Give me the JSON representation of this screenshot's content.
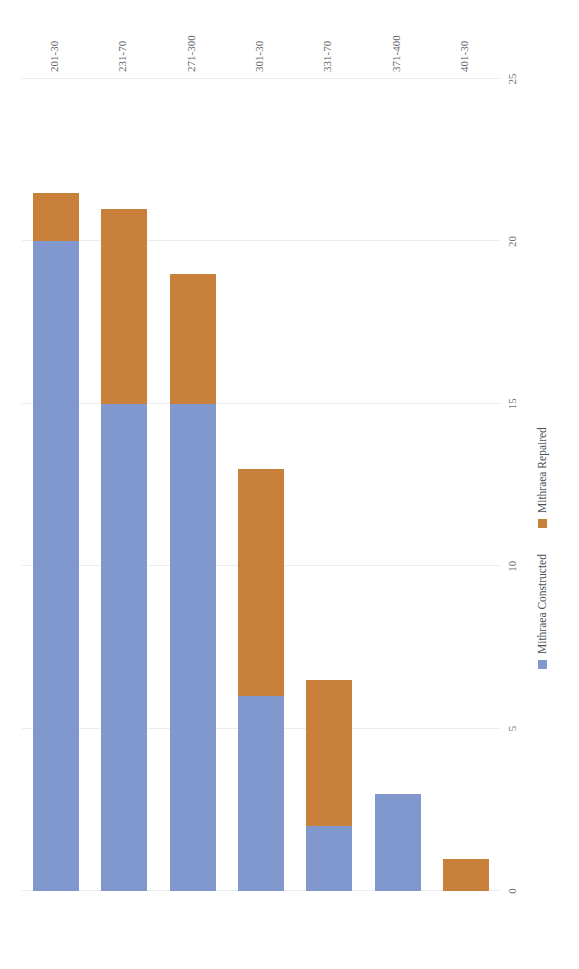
{
  "chart_data": {
    "type": "bar",
    "orientation": "horizontal-stacked-rotated",
    "title": "",
    "xlabel": "",
    "ylabel": "",
    "categories": [
      "201-30",
      "231-70",
      "271-300",
      "301-30",
      "331-70",
      "371-400",
      "401-30"
    ],
    "series": [
      {
        "name": "Mithraea Constructed",
        "color": "#8098cd",
        "values": [
          20,
          15,
          15,
          6,
          2,
          3,
          0
        ]
      },
      {
        "name": "Mithraea Repaired",
        "color": "#c8803a",
        "values": [
          1.5,
          6,
          4,
          7,
          4.5,
          0,
          1
        ]
      }
    ],
    "totals": [
      21.5,
      21,
      19,
      13,
      6.5,
      3,
      1
    ],
    "xlim": [
      0,
      25
    ],
    "ticks": [
      "0",
      "5",
      "10",
      "15",
      "20",
      "25"
    ],
    "tick_values": [
      0,
      5,
      10,
      15,
      20,
      25
    ],
    "grid": true,
    "legend_position": "bottom-center",
    "value_axis_direction": "right-to-left"
  },
  "legend": {
    "constructed_label": "Mithraea Constructed",
    "repaired_label": "Mithraea Repaired"
  }
}
